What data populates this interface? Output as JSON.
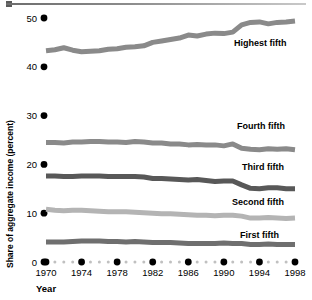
{
  "chart_data": {
    "type": "line",
    "title": "",
    "xlabel": "Year",
    "ylabel": "Share of aggregate income (percent)",
    "xlim": [
      1970,
      1998
    ],
    "ylim": [
      0,
      52
    ],
    "xticks": [
      1970,
      1974,
      1978,
      1982,
      1986,
      1990,
      1994,
      1998
    ],
    "xticklabels": [
      "1970",
      "1974",
      "1978",
      "1982",
      "1986",
      "1990",
      "1994",
      "1998"
    ],
    "yticks": [
      0,
      10,
      20,
      30,
      40,
      50
    ],
    "yticklabels": [
      "0",
      "10",
      "20",
      "30",
      "40",
      "50"
    ],
    "grid": false,
    "legend_position": "inline-right",
    "x": [
      1970,
      1971,
      1972,
      1973,
      1974,
      1975,
      1976,
      1977,
      1978,
      1979,
      1980,
      1981,
      1982,
      1983,
      1984,
      1985,
      1986,
      1987,
      1988,
      1989,
      1990,
      1991,
      1992,
      1993,
      1994,
      1995,
      1996,
      1997,
      1998
    ],
    "series": [
      {
        "name": "Highest fifth",
        "color": "#8a8a8a",
        "values": [
          43.3,
          43.5,
          43.9,
          43.4,
          43.1,
          43.2,
          43.3,
          43.6,
          43.7,
          44.0,
          44.1,
          44.3,
          45.0,
          45.3,
          45.6,
          45.9,
          46.5,
          46.3,
          46.7,
          46.9,
          46.8,
          47.1,
          48.6,
          49.1,
          49.2,
          48.8,
          49.1,
          49.2,
          49.4
        ]
      },
      {
        "name": "Fourth fifth",
        "color": "#8a8a8a",
        "values": [
          24.5,
          24.5,
          24.4,
          24.6,
          24.6,
          24.7,
          24.7,
          24.6,
          24.6,
          24.5,
          24.7,
          24.6,
          24.4,
          24.4,
          24.2,
          24.2,
          24.0,
          24.1,
          24.0,
          24.0,
          23.8,
          24.2,
          23.3,
          23.1,
          23.0,
          23.2,
          23.1,
          23.2,
          23.0
        ]
      },
      {
        "name": "Third fifth",
        "color": "#585858",
        "values": [
          17.6,
          17.6,
          17.5,
          17.5,
          17.6,
          17.6,
          17.6,
          17.5,
          17.5,
          17.5,
          17.5,
          17.4,
          17.1,
          17.1,
          17.0,
          16.9,
          16.8,
          16.9,
          16.7,
          16.5,
          16.6,
          16.6,
          15.8,
          15.1,
          15.0,
          15.2,
          15.2,
          15.0,
          15.0
        ]
      },
      {
        "name": "Second fifth",
        "color": "#b4b4b4",
        "values": [
          10.8,
          10.6,
          10.5,
          10.6,
          10.6,
          10.5,
          10.4,
          10.3,
          10.3,
          10.3,
          10.2,
          10.1,
          10.0,
          9.9,
          9.9,
          9.8,
          9.7,
          9.6,
          9.6,
          9.5,
          9.6,
          9.6,
          9.4,
          9.0,
          9.0,
          9.1,
          9.0,
          8.9,
          9.0
        ]
      },
      {
        "name": "First fifth",
        "color": "#6f6f6f",
        "values": [
          4.1,
          4.1,
          4.1,
          4.2,
          4.3,
          4.3,
          4.3,
          4.2,
          4.2,
          4.1,
          4.2,
          4.1,
          4.0,
          4.0,
          4.0,
          3.9,
          3.8,
          3.8,
          3.8,
          3.8,
          3.9,
          3.8,
          3.8,
          3.6,
          3.6,
          3.7,
          3.6,
          3.6,
          3.6
        ]
      }
    ],
    "series_labels": [
      {
        "name": "Highest fifth",
        "label_x": 234,
        "label_y": 46
      },
      {
        "name": "Fourth fifth",
        "label_x": 237,
        "label_y": 129
      },
      {
        "name": "Third fifth",
        "label_x": 242,
        "label_y": 170
      },
      {
        "name": "Second fifth",
        "label_x": 232,
        "label_y": 205
      },
      {
        "name": "First fifth",
        "label_x": 240,
        "label_y": 238
      }
    ],
    "axis_dot_color": "#000000",
    "minor_dot_color": "#c0c0c0"
  }
}
